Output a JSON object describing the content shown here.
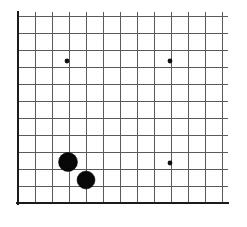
{
  "figure": {
    "kind": "go-board-diagram",
    "board_size": 19,
    "region_shown": "bottom-left corner",
    "background_color": "#ffffff",
    "grid_line_color": "#5a5a5a",
    "edge_line_color": "#1a1a1a",
    "stone_black_color": "#080808",
    "star_point_color": "#111111"
  },
  "chart_data": {
    "type": "scatter",
    "xlabel": "",
    "ylabel": "",
    "grid": true,
    "legend_position": "none",
    "xlim": [
      18,
      222
    ],
    "ylim": [
      16,
      203
    ],
    "grid_spacing_px": 17,
    "vertical_lines_x": [
      18,
      35,
      52,
      69,
      86,
      103,
      120,
      137,
      154,
      171,
      188,
      205,
      222
    ],
    "horizontal_lines_y": [
      16,
      33,
      50,
      67,
      84,
      101,
      118,
      135,
      152,
      169,
      186,
      203
    ],
    "edges": [
      {
        "name": "left-board-edge",
        "x1": 18,
        "y1": 12,
        "x2": 18,
        "y2": 204
      },
      {
        "name": "bottom-board-edge",
        "x1": 17,
        "y1": 203,
        "x2": 228,
        "y2": 203
      }
    ],
    "star_points": [
      {
        "label": "star-point-upper-left",
        "cx": 67,
        "cy": 61,
        "r": 2.4
      },
      {
        "label": "star-point-upper-right",
        "cx": 170,
        "cy": 61,
        "r": 2.4
      },
      {
        "label": "star-point-lower-right",
        "cx": 170,
        "cy": 163,
        "r": 2.4
      }
    ],
    "stones": [
      {
        "label": "black-stone-1",
        "color": "black",
        "cx": 68,
        "cy": 162,
        "r": 9.5
      },
      {
        "label": "black-stone-2",
        "color": "black",
        "cx": 86,
        "cy": 180,
        "r": 9.0
      }
    ],
    "counts": {
      "vertical_lines": 13,
      "horizontal_lines": 12,
      "star_points": 3,
      "black_stones": 2,
      "white_stones": 0
    }
  }
}
